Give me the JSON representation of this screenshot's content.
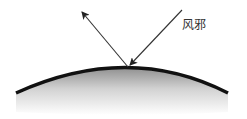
{
  "diagram": {
    "label": "风邪",
    "colors": {
      "line": "#111111",
      "arrow": "#222222",
      "shade_top": "#9a9a9a",
      "shade_bottom": "#ffffff",
      "text": "#333333"
    },
    "elements": {
      "surface": "curved-surface",
      "incoming_arrow": "wind-evil-incoming-arrow",
      "reflected_arrow": "deflected-arrow"
    }
  }
}
